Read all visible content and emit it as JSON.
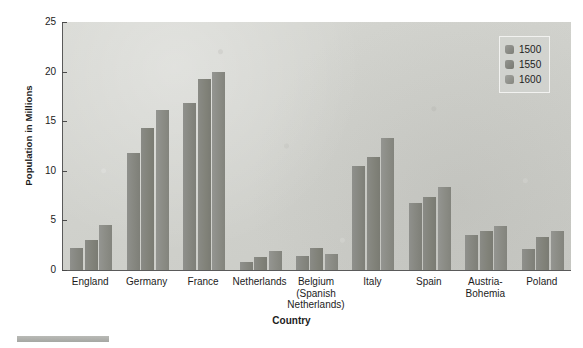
{
  "chart_data": {
    "type": "bar",
    "title": "",
    "xlabel": "Country",
    "ylabel": "Population in Millions",
    "ylim": [
      0,
      25
    ],
    "yticks": [
      0,
      5,
      10,
      15,
      20,
      25
    ],
    "grid": false,
    "legend_position": "top-right",
    "categories": [
      "England",
      "Germany",
      "France",
      "Netherlands",
      "Belgium\n(Spanish\nNetherlands)",
      "Italy",
      "Spain",
      "Austria-\nBohemia",
      "Poland"
    ],
    "series": [
      {
        "name": "1500",
        "values": [
          2.2,
          11.8,
          16.8,
          0.8,
          1.4,
          10.5,
          6.8,
          3.5,
          2.1
        ]
      },
      {
        "name": "1550",
        "values": [
          3.0,
          14.3,
          19.3,
          1.3,
          2.2,
          11.4,
          7.4,
          3.9,
          3.3
        ]
      },
      {
        "name": "1600",
        "values": [
          4.5,
          16.1,
          20.0,
          1.9,
          1.6,
          13.3,
          8.4,
          4.4,
          3.9
        ]
      }
    ],
    "colors": {
      "series_1500": "#85867f",
      "series_1550": "#81827a",
      "series_1600": "#8a8b84",
      "plot_background": "#d2d3cf",
      "axis": "#5a5a5a",
      "text": "#1c1c1c"
    }
  },
  "legend": {
    "entries": [
      {
        "label": "1500"
      },
      {
        "label": "1550"
      },
      {
        "label": "1600"
      }
    ]
  }
}
